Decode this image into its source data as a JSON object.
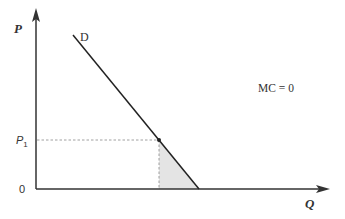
{
  "diagram": {
    "type": "economics-demand-curve",
    "axes": {
      "y_label": "P",
      "x_label": "Q",
      "origin_label": "0"
    },
    "curve_label": "D",
    "price_label": "P",
    "price_subscript": "1",
    "annotation": "MC = 0",
    "colors": {
      "axis": "#333333",
      "curve": "#222222",
      "dashed": "#888888",
      "shaded_area": "#e4e4e4",
      "point": "#222222",
      "text": "#333333"
    }
  }
}
